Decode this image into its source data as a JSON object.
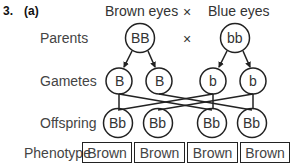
{
  "question": {
    "number": "3.",
    "part": "(a)"
  },
  "header": {
    "left": "Brown eyes",
    "cross": "×",
    "right": "Blue eyes"
  },
  "rows": {
    "parents": "Parents",
    "gametes": "Gametes",
    "offspring": "Offspring",
    "phenotype": "Phenotype"
  },
  "parents": {
    "left": "BB",
    "cross": "×",
    "right": "bb"
  },
  "gametes": [
    "B",
    "B",
    "b",
    "b"
  ],
  "offspring": [
    "Bb",
    "Bb",
    "Bb",
    "Bb"
  ],
  "phenotypes": [
    "Brown",
    "Brown",
    "Brown",
    "Brown"
  ]
}
